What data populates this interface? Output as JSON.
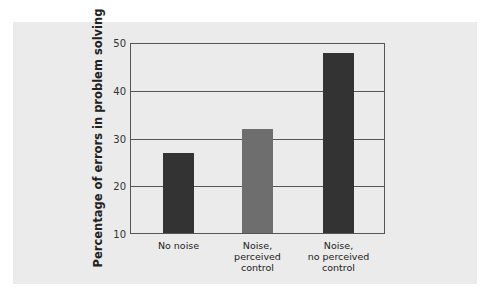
{
  "chart_data": {
    "type": "bar",
    "title": "",
    "xlabel": "",
    "ylabel": "Percentage of errors in problem solving",
    "categories": [
      "No noise",
      "Noise, perceived control",
      "Noise, no perceived control"
    ],
    "category_lines": [
      [
        "No noise"
      ],
      [
        "Noise,",
        "perceived",
        "control"
      ],
      [
        "Noise,",
        "no perceived",
        "control"
      ]
    ],
    "values": [
      27,
      32,
      48
    ],
    "bar_colors": [
      "#333333",
      "#6e6e6e",
      "#333333"
    ],
    "ylim": [
      10,
      50
    ],
    "yticks": [
      10,
      20,
      30,
      40,
      50
    ],
    "grid": true,
    "legend": null
  },
  "colors": {
    "panel_background": "#ebebeb",
    "axis": "#555555"
  }
}
